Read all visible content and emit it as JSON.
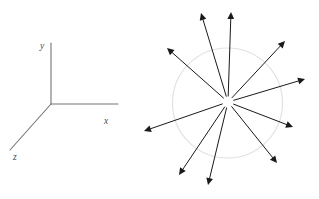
{
  "figure": {
    "background_color": "#ffffff",
    "panels": [
      {
        "name": "coordinate-axes",
        "kind": "3d-axis-triad",
        "origin": [
          51,
          104
        ],
        "line_color": "#757575",
        "line_width": 1.1,
        "axes": [
          {
            "id": "y",
            "label": "y",
            "tip": [
              51,
              43
            ],
            "label_pos": [
              40,
              49
            ]
          },
          {
            "id": "x",
            "label": "x",
            "tip": [
              118,
              104
            ],
            "label_pos": [
              104,
              124
            ]
          },
          {
            "id": "z",
            "label": "z",
            "tip": [
              10,
              150
            ],
            "label_pos": [
              13,
              160
            ]
          }
        ]
      },
      {
        "name": "radial-vector-field",
        "kind": "arrow-burst",
        "center": [
          228,
          102
        ],
        "circle": {
          "cx": 227.5,
          "cy": 103,
          "r": 55,
          "stroke": "#e6e0e0",
          "stroke_width": 1.2,
          "fill": "none"
        },
        "arrow_color": "#1a1a1a",
        "arrow_width": 1.0,
        "arrow_head_length": 7,
        "arrow_head_width": 3.4,
        "inner_gap": 6,
        "arrows": [
          {
            "id": "arrow-up-left-steep",
            "tip": [
              201,
              13
            ],
            "angle_deg": 107.5,
            "length": 92
          },
          {
            "id": "arrow-up",
            "tip": [
              231,
              12
            ],
            "angle_deg": 91.2,
            "length": 90
          },
          {
            "id": "arrow-up-right",
            "tip": [
              285,
              41
            ],
            "angle_deg": 43.5,
            "length": 83
          },
          {
            "id": "arrow-right",
            "tip": [
              305,
              79
            ],
            "angle_deg": 16.5,
            "length": 80
          },
          {
            "id": "arrow-right-low",
            "tip": [
              293,
              127
            ],
            "angle_deg": -20.0,
            "length": 69
          },
          {
            "id": "arrow-lower-right",
            "tip": [
              277,
              163
            ],
            "angle_deg": -45.5,
            "length": 84
          },
          {
            "id": "arrow-down",
            "tip": [
              208,
              185
            ],
            "angle_deg": -104.0,
            "length": 86
          },
          {
            "id": "arrow-down-left",
            "tip": [
              179,
              175
            ],
            "angle_deg": -124.5,
            "length": 88
          },
          {
            "id": "arrow-left",
            "tip": [
              144,
              131
            ],
            "angle_deg": -163.0,
            "length": 88
          },
          {
            "id": "arrow-upper-left",
            "tip": [
              167,
              48
            ],
            "angle_deg": 138.0,
            "length": 81
          }
        ]
      }
    ]
  }
}
